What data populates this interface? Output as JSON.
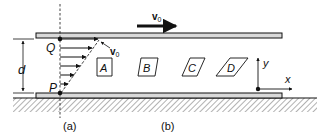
{
  "figure": {
    "panel_a_label": "(a)",
    "panel_b_label": "(b)"
  },
  "labels": {
    "plate_velocity": "v",
    "plate_velocity_sub": "0",
    "profile_velocity": "v",
    "profile_velocity_sub": "0",
    "point_top": "Q",
    "point_bottom": "P",
    "gap": "d",
    "axis_x": "x",
    "axis_y": "y"
  },
  "elements": [
    {
      "id": "A",
      "label": "A",
      "shape": "square"
    },
    {
      "id": "B",
      "label": "B",
      "shape": "parallelogram-slight"
    },
    {
      "id": "C",
      "label": "C",
      "shape": "parallelogram-medium"
    },
    {
      "id": "D",
      "label": "D",
      "shape": "parallelogram-strong"
    }
  ],
  "colors": {
    "line": "#111111",
    "plate_fill": "#d9d9d9",
    "hatch": "#555555"
  }
}
